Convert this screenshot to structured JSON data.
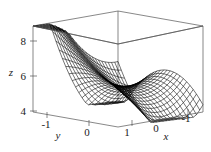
{
  "figure": {
    "kind": "3d-surface-mesh-plot",
    "background": "#ffffff",
    "mesh_color": "#000000",
    "axis_color": "#555555",
    "text_color": "#1a1a1a"
  },
  "chart_data": {
    "type": "surface",
    "title": "",
    "xlabel": "x",
    "ylabel": "y",
    "zlabel": "z",
    "xlim": [
      -1,
      1
    ],
    "ylim": [
      -1,
      1
    ],
    "zlim": [
      4,
      8.6
    ],
    "grid": false,
    "legend": null,
    "x_ticks": [
      1,
      0,
      -1
    ],
    "x_tick_labels": [
      "1",
      "0",
      "-1"
    ],
    "y_ticks": [
      -1,
      0
    ],
    "y_tick_labels": [
      "-1",
      "0"
    ],
    "z_ticks": [
      4,
      6,
      8
    ],
    "z_tick_labels": [
      "4",
      "6",
      "8"
    ],
    "x_axis_reversed": true,
    "mesh_nx": 26,
    "mesh_ny": 26,
    "view": {
      "azimuth_deg": 226,
      "elevation_deg": 22
    },
    "surface_expression": "5.5 + 1.6*x*x + 1.9*y*y*x - 1.2*y*y + 1.05*x - 0.75*y - 1.5*x*y + 0.9*x*x*y*y",
    "z_range_observed": [
      4.0,
      8.6
    ],
    "features": [
      "low valley across front-center near z=4",
      "broad hump on the left lobe near z=6.5",
      "sharp ridge fold near the middle of the box",
      "steep rise to the back-right corner reaching z=8.6"
    ]
  },
  "labels": {
    "z_axis_title": "z",
    "y_axis_title": "y",
    "x_axis_title": "x",
    "z_ticks": [
      "8",
      "6",
      "4"
    ],
    "y_ticks": [
      "-1",
      "0"
    ],
    "x_ticks": [
      "1",
      "0",
      "-1"
    ]
  }
}
